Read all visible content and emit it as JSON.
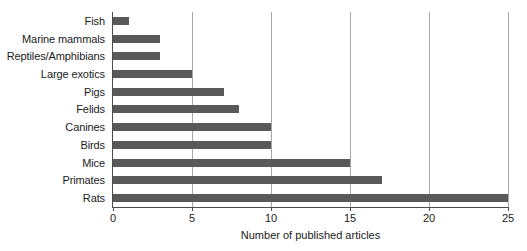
{
  "chart_data": {
    "type": "bar",
    "orientation": "horizontal",
    "title": "",
    "xlabel": "Number of published articles",
    "ylabel": "",
    "categories": [
      "Fish",
      "Marine mammals",
      "Reptiles/Amphibians",
      "Large exotics",
      "Pigs",
      "Felids",
      "Canines",
      "Birds",
      "Mice",
      "Primates",
      "Rats"
    ],
    "values": [
      1,
      3,
      3,
      5,
      7,
      8,
      10,
      10,
      15,
      17,
      25
    ],
    "xlim": [
      0,
      25
    ],
    "xticks": [
      0,
      5,
      10,
      15,
      20,
      25
    ],
    "xtick_labels": [
      "0",
      "5",
      "10",
      "15",
      "20",
      "25"
    ],
    "grid": "vertical",
    "legend": "none",
    "bar_color": "#595959",
    "gridline_color": "#a8a8a8",
    "axis_color": "#4d4d4d",
    "background_color": "#ffffff"
  }
}
